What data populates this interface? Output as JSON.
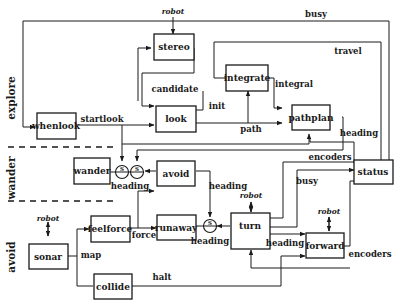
{
  "diagram": {
    "layers": [
      {
        "id": "explore",
        "label": "explore"
      },
      {
        "id": "wander",
        "label": "wander"
      },
      {
        "id": "avoid",
        "label": "avoid"
      }
    ],
    "modules": {
      "stereo": "stereo",
      "look": "look",
      "integrate": "integrate",
      "pathplan": "pathplan",
      "whenlook": "whenlook",
      "status": "status",
      "wander": "wander",
      "avoid": "avoid",
      "sonar": "sonar",
      "feelforce": "feelforce",
      "runaway": "runaway",
      "turn": "turn",
      "forward": "forward",
      "collide": "collide"
    },
    "signals": {
      "robot_stereo": "robot",
      "busy_top": "busy",
      "travel": "travel",
      "candidate": "candidate",
      "init": "init",
      "integral": "integral",
      "startlook": "startlook",
      "path": "path",
      "heading_pathplan": "heading",
      "encoders_status": "encoders",
      "heading_wander": "heading",
      "heading_avoid": "heading",
      "busy_turn": "busy",
      "robot_turn": "robot",
      "heading_runaway": "heading",
      "force": "force",
      "robot_forward": "robot",
      "robot_sonar": "robot",
      "map": "map",
      "heading_turn": "heading",
      "encoders_forward": "encoders",
      "halt": "halt"
    },
    "suppressor_label": "S",
    "colors": {
      "ink": "#1a1a1a",
      "background": "#ffffff"
    }
  }
}
